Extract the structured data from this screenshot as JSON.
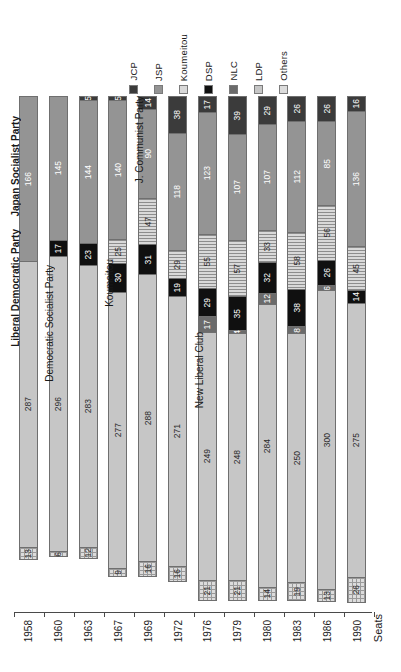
{
  "chart_data": {
    "type": "bar",
    "orientation": "stacked-vertical-rotated",
    "title": "",
    "xlabel": "",
    "ylabel": "Seats",
    "categories": [
      "1958",
      "1960",
      "1963",
      "1967",
      "1969",
      "1972",
      "1976",
      "1979",
      "1980",
      "1983",
      "1986",
      "1990"
    ],
    "ylim": [
      0,
      512
    ],
    "grid": false,
    "legend_position": "top",
    "series": [
      {
        "name": "JCP",
        "color": "#3b3b3b",
        "values": [
          0,
          0,
          5,
          5,
          14,
          38,
          17,
          39,
          29,
          26,
          26,
          16
        ]
      },
      {
        "name": "JSP",
        "color": "#949494",
        "values": [
          166,
          145,
          144,
          140,
          90,
          118,
          123,
          107,
          107,
          112,
          85,
          136
        ]
      },
      {
        "name": "Koumeitou",
        "color": "#d9d9d9",
        "values": [
          0,
          0,
          0,
          25,
          47,
          29,
          55,
          57,
          33,
          58,
          56,
          45
        ]
      },
      {
        "name": "DSP",
        "color": "#101010",
        "values": [
          0,
          17,
          23,
          30,
          31,
          19,
          29,
          35,
          32,
          38,
          26,
          14
        ]
      },
      {
        "name": "NLC",
        "color": "#6b6b6b",
        "values": [
          0,
          0,
          0,
          0,
          0,
          0,
          17,
          4,
          12,
          8,
          6,
          0
        ]
      },
      {
        "name": "LDP",
        "color": "#c6c6c6",
        "values": [
          287,
          296,
          283,
          277,
          288,
          271,
          249,
          248,
          284,
          250,
          300,
          275
        ]
      },
      {
        "name": "Others",
        "color": "#dcdcdc",
        "values": [
          13,
          6,
          12,
          9,
          16,
          16,
          21,
          21,
          14,
          19,
          13,
          26
        ]
      }
    ],
    "annotations": [
      {
        "text": "Japan Socialist Party",
        "series": "JSP",
        "category": "1958"
      },
      {
        "text": "Liberal Democratic Party",
        "series": "LDP",
        "category": "1958"
      },
      {
        "text": "Democratic Socialist Party",
        "series": "DSP",
        "category": "1960"
      },
      {
        "text": "Koumeitou",
        "series": "Koumeitou",
        "category": "1963"
      },
      {
        "text": "J. Communist Party",
        "series": "JCP",
        "category": "1969"
      },
      {
        "text": "New Liberal Club",
        "series": "NLC",
        "category": "1972"
      }
    ]
  },
  "legend": {
    "items": [
      {
        "label": "JCP",
        "swatch": "legend-swatch-jcp",
        "color": "#3b3b3b",
        "pattern": "solid"
      },
      {
        "label": "JSP",
        "swatch": "legend-swatch-jsp",
        "color": "#949494",
        "pattern": "solid"
      },
      {
        "label": "Koumeitou",
        "swatch": "legend-swatch-koumeitou",
        "color": "#d9d9d9",
        "pattern": "lines"
      },
      {
        "label": "DSP",
        "swatch": "legend-swatch-dsp",
        "color": "#101010",
        "pattern": "solid"
      },
      {
        "label": "NLC",
        "swatch": "legend-swatch-nlc",
        "color": "#6b6b6b",
        "pattern": "solid"
      },
      {
        "label": "LDP",
        "swatch": "legend-swatch-ldp",
        "color": "#c6c6c6",
        "pattern": "solid"
      },
      {
        "label": "Others",
        "swatch": "legend-swatch-others",
        "color": "#dcdcdc",
        "pattern": "cross"
      }
    ]
  },
  "axis": {
    "title": "Seats",
    "tick_labels": [
      "1958",
      "1960",
      "1963",
      "1967",
      "1969",
      "1972",
      "1976",
      "1979",
      "1980",
      "1983",
      "1986",
      "1990"
    ]
  },
  "segment_labels": {
    "1958": {
      "JSP": "166",
      "LDP": "287",
      "Others": "13"
    },
    "1960": {
      "JSP": "145",
      "DSP": "17",
      "LDP": "296",
      "Others": "6"
    },
    "1963": {
      "JCP": "5",
      "JSP": "144",
      "DSP": "23",
      "LDP": "283",
      "Others": "12"
    },
    "1967": {
      "JCP": "5",
      "JSP": "140",
      "Koumeitou": "25",
      "DSP": "30",
      "LDP": "277",
      "Others": "9"
    },
    "1969": {
      "JCP": "14",
      "JSP": "90",
      "Koumeitou": "47",
      "DSP": "31",
      "LDP": "288",
      "Others": "16"
    },
    "1972": {
      "JCP": "38",
      "JSP": "118",
      "Koumeitou": "29",
      "DSP": "19",
      "LDP": "271",
      "Others": "16"
    },
    "1976": {
      "JCP": "17",
      "JSP": "123",
      "Koumeitou": "55",
      "DSP": "29",
      "NLC": "17",
      "LDP": "249",
      "Others": "21"
    },
    "1979": {
      "JCP": "39",
      "JSP": "107",
      "Koumeitou": "57",
      "DSP": "35",
      "NLC": "4",
      "LDP": "248",
      "Others": "21"
    },
    "1980": {
      "JCP": "29",
      "JSP": "107",
      "Koumeitou": "33",
      "DSP": "32",
      "NLC": "12",
      "LDP": "284",
      "Others": "14"
    },
    "1983": {
      "JCP": "26",
      "JSP": "112",
      "Koumeitou": "58",
      "DSP": "38",
      "NLC": "8",
      "LDP": "250",
      "Others": "19"
    },
    "1986": {
      "JCP": "26",
      "JSP": "85",
      "Koumeitou": "56",
      "DSP": "26",
      "NLC": "6",
      "LDP": "300",
      "Others": "13"
    },
    "1990": {
      "JCP": "16",
      "JSP": "136",
      "Koumeitou": "45",
      "DSP": "14",
      "LDP": "275",
      "Others": "26"
    }
  }
}
